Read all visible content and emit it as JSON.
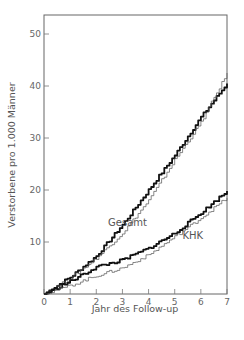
{
  "chart_data": {
    "type": "line",
    "title": "",
    "xlabel": "Jahr des Follow-up",
    "ylabel": "Verstorbene pro 1.000 Männer",
    "xlim": [
      0,
      7
    ],
    "ylim": [
      0,
      55
    ],
    "x_ticks": [
      0,
      1,
      2,
      3,
      4,
      5,
      6,
      7
    ],
    "y_ticks": [
      10,
      20,
      30,
      40,
      50
    ],
    "grid": false,
    "legend": "none (inline labels)",
    "x": [
      0,
      1,
      2,
      3,
      4,
      5,
      6,
      7
    ],
    "series": [
      {
        "name": "Gesamt (thick)",
        "group": "Gesamt",
        "style": "thick",
        "values": [
          0,
          3.2,
          7.3,
          13.3,
          20.0,
          26.7,
          34.0,
          40.5
        ]
      },
      {
        "name": "Gesamt (thin)",
        "group": "Gesamt",
        "style": "thin",
        "values": [
          0,
          3.0,
          6.9,
          11.7,
          18.0,
          25.8,
          33.0,
          42.5
        ]
      },
      {
        "name": "KHK (thick)",
        "group": "KHK",
        "style": "thick",
        "values": [
          0,
          2.4,
          5.2,
          6.5,
          8.8,
          11.7,
          15.6,
          19.8
        ]
      },
      {
        "name": "KHK (thin)",
        "group": "KHK",
        "style": "thin",
        "values": [
          0,
          1.6,
          3.5,
          5.0,
          7.5,
          11.0,
          14.6,
          18.5
        ]
      }
    ],
    "annotations": [
      {
        "text": "Gesamt",
        "x": 2.45,
        "y": 13
      },
      {
        "text": "KHK",
        "x": 5.3,
        "y": 10.5
      }
    ]
  }
}
